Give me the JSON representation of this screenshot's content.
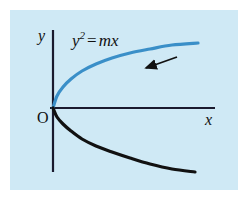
{
  "figure": {
    "name": "parabola-y-squared-equals-mx",
    "background_color": "#ffffff",
    "panel_color": "#cfe9f5",
    "equation": {
      "base": "y",
      "exponent": "2",
      "operator": "=",
      "right": "mx",
      "full": "y² = mx"
    },
    "axis_labels": {
      "x": "x",
      "y": "y",
      "origin": "O"
    }
  },
  "chart_data": {
    "type": "line",
    "xlabel": "x",
    "ylabel": "y",
    "annotations": [
      {
        "name": "equation-label",
        "text": "y² = mx",
        "x_px": 72,
        "y_px": 30
      },
      {
        "name": "direction-arrow",
        "text": "",
        "from_px": [
          177,
          57
        ],
        "to_px": [
          143,
          69
        ],
        "color": "#111111"
      }
    ],
    "grid": false,
    "legend": null,
    "axes": {
      "origin_px": [
        53,
        108
      ],
      "x_axis_px": {
        "from": [
          50,
          108
        ],
        "to": [
          215,
          108
        ]
      },
      "y_axis_px": {
        "from": [
          53,
          30
        ],
        "to": [
          53,
          172
        ]
      },
      "color": "#1a1a2e"
    },
    "series": [
      {
        "name": "upper-branch",
        "label": "y = +√(mx)",
        "color": "#3a8fc8",
        "linewidth": 3.2,
        "points_px": [
          [
            53,
            108
          ],
          [
            57,
            96
          ],
          [
            63,
            87
          ],
          [
            71,
            79
          ],
          [
            82,
            71
          ],
          [
            96,
            64
          ],
          [
            112,
            58
          ],
          [
            130,
            53
          ],
          [
            150,
            49
          ],
          [
            172,
            45
          ],
          [
            198,
            43
          ]
        ]
      },
      {
        "name": "lower-branch",
        "label": "y = −√(mx)",
        "color": "#111111",
        "linewidth": 3.2,
        "points_px": [
          [
            53,
            108
          ],
          [
            57,
            117
          ],
          [
            63,
            124
          ],
          [
            71,
            131
          ],
          [
            82,
            139
          ],
          [
            96,
            146
          ],
          [
            112,
            152
          ],
          [
            130,
            158
          ],
          [
            150,
            164
          ],
          [
            172,
            169
          ],
          [
            195,
            172
          ]
        ]
      }
    ]
  }
}
